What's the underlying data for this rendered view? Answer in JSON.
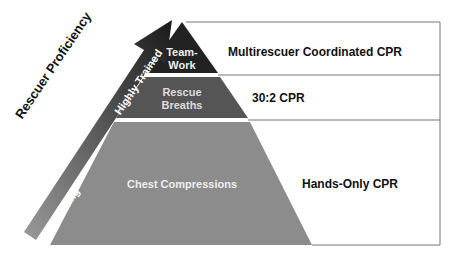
{
  "diagram": {
    "type": "pyramid",
    "arrow": {
      "title": "Rescuer Proficiency",
      "low_label": "No Training",
      "high_label": "Highly Trained"
    },
    "tiers": [
      {
        "label_line1": "Team-",
        "label_line2": "Work",
        "description": "Multirescuer Coordinated CPR",
        "color": "#222222"
      },
      {
        "label_line1": "Rescue",
        "label_line2": "Breaths",
        "description": "30:2 CPR",
        "color": "#555555"
      },
      {
        "label_line1": "Chest Compressions",
        "label_line2": "",
        "description": "Hands-Only CPR",
        "color": "#8c8c8c"
      }
    ]
  }
}
